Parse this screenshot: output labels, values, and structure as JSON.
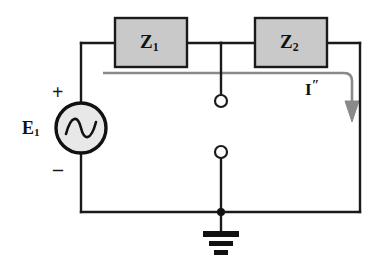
{
  "diagram": {
    "type": "electrical-schematic",
    "canvas": {
      "width": 390,
      "height": 267,
      "background": "#ffffff"
    },
    "colors": {
      "wire": "#1a1a1a",
      "box_fill": "#c9c9c9",
      "box_stroke": "#1a1a1a",
      "source_fill": "#e8e8e8",
      "current_path": "#8a8a8a",
      "ground": "#111111",
      "text": "#111111"
    },
    "components": {
      "source": {
        "name": "voltage-source",
        "label": "E",
        "subscript": "1",
        "symbol": "ac-sine",
        "plus_sign": "+",
        "minus_sign": "–",
        "center": {
          "x": 81,
          "y": 128
        },
        "radius": 25
      },
      "impedance_1": {
        "name": "impedance-z1",
        "label": "Z",
        "subscript": "1",
        "box": {
          "x": 115,
          "y": 18,
          "width": 72,
          "height": 49
        }
      },
      "impedance_2": {
        "name": "impedance-z2",
        "label": "Z",
        "subscript": "2",
        "box": {
          "x": 255,
          "y": 18,
          "width": 72,
          "height": 49
        }
      },
      "current": {
        "name": "current-i-double-prime",
        "label": "I",
        "prime": "″",
        "direction": "downward",
        "position": {
          "x": 305,
          "y": 86
        }
      },
      "terminals": [
        {
          "name": "terminal-upper",
          "cx": 221,
          "cy": 101,
          "r": 6
        },
        {
          "name": "terminal-lower",
          "cx": 221,
          "cy": 152,
          "r": 6
        }
      ],
      "ground": {
        "name": "ground-symbol",
        "x": 221,
        "y": 212,
        "bars": 3
      }
    },
    "nodes": {
      "top_left": {
        "x": 81,
        "y": 43
      },
      "top_right": {
        "x": 360,
        "y": 43
      },
      "bottom_left": {
        "x": 81,
        "y": 212
      },
      "bottom_right": {
        "x": 360,
        "y": 212
      },
      "center_tap": {
        "x": 221,
        "y": 43
      },
      "ground_junction": {
        "x": 221,
        "y": 212
      }
    }
  }
}
